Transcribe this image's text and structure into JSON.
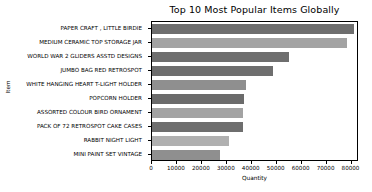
{
  "chart_data": {
    "type": "bar",
    "orientation": "horizontal",
    "title": "Top 10 Most Popular Items Globally",
    "xlabel": "Quantity",
    "ylabel": "Item",
    "categories": [
      "PAPER CRAFT , LITTLE BIRDIE",
      "MEDIUM CERAMIC TOP STORAGE JAR",
      "WORLD WAR 2 GLIDERS ASSTD DESIGNS",
      "JUMBO BAG RED RETROSPOT",
      "WHITE HANGING HEART T-LIGHT HOLDER",
      "POPCORN HOLDER",
      "ASSORTED COLOUR BIRD ORNAMENT",
      "PACK OF 72 RETROSPOT CAKE CASES",
      "RABBIT NIGHT LIGHT",
      "MINI PAINT SET VINTAGE"
    ],
    "values": [
      80995,
      78033,
      55047,
      48478,
      37872,
      36761,
      36461,
      36419,
      30788,
      27202
    ],
    "xlim": [
      0,
      83000
    ],
    "xticks": [
      0,
      10000,
      20000,
      30000,
      40000,
      50000,
      60000,
      70000,
      80000
    ],
    "xtick_labels": [
      "0",
      "10000",
      "20000",
      "30000",
      "40000",
      "50000",
      "60000",
      "70000",
      "80000"
    ],
    "grid": false,
    "legend": null,
    "bar_colors": [
      "#6e6e6e",
      "#a3a3a3",
      "#6e6e6e",
      "#6e6e6e",
      "#8f8f8f",
      "#6b6b6b",
      "#a3a3a3",
      "#6e6e6e",
      "#b0b0b0",
      "#8f8f8f"
    ]
  }
}
